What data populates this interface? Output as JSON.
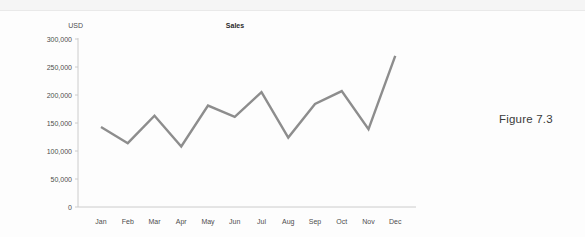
{
  "caption": "Figure 7.3",
  "chart_data": {
    "type": "line",
    "title": "Sales",
    "ylabel": "USD",
    "categories": [
      "Jan",
      "Feb",
      "Mar",
      "Apr",
      "May",
      "Jun",
      "Jul",
      "Aug",
      "Sep",
      "Oct",
      "Nov",
      "Dec"
    ],
    "values": [
      143000,
      114000,
      163000,
      108000,
      181000,
      161000,
      205000,
      124000,
      184000,
      207000,
      139000,
      270000
    ],
    "ylim": [
      0,
      300000
    ],
    "ytick_step": 50000,
    "ytick_labels": [
      "0",
      "50,000",
      "100,000",
      "150,000",
      "200,000",
      "250,000",
      "300,000"
    ],
    "grid": false,
    "legend": "none",
    "line_color": "#8d8d8d",
    "axis_color": "#cccccc",
    "tick_text_color": "#4d4d4d",
    "title_color": "#2b2b2b"
  }
}
